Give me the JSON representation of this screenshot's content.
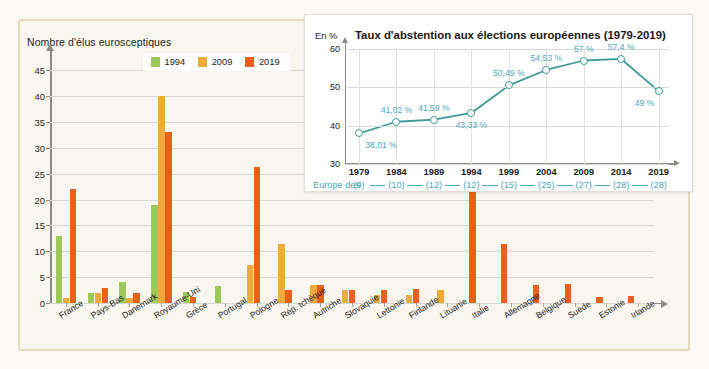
{
  "figure": {
    "background_color": "#f8f6ef",
    "border_color": "#e6d9b8"
  },
  "bar_chart": {
    "y_axis_title": "Nombre d'élus eurosceptiques",
    "y_ticks": [
      "0",
      "5",
      "10",
      "15",
      "20",
      "25",
      "30",
      "35",
      "40",
      "45"
    ],
    "legend": [
      {
        "label": "1994",
        "color": "#9dc95a"
      },
      {
        "label": "2009",
        "color": "#f0a93c"
      },
      {
        "label": "2019",
        "color": "#e8601c"
      }
    ]
  },
  "inset_chart": {
    "title": "Taux d'abstention aux élections européennes (1979-2019)",
    "unit_label": "En %",
    "y_ticks": [
      "30",
      "40",
      "50",
      "60"
    ],
    "europe_label": "Europe des",
    "line_color": "#3f9a9a",
    "label_color": "#4aa8bd"
  },
  "chart_data": [
    {
      "type": "bar",
      "title": "",
      "ylabel": "Nombre d'élus eurosceptiques",
      "xlabel": "",
      "ylim": [
        0,
        47
      ],
      "grid": true,
      "legend_position": "top-center",
      "categories": [
        "France",
        "Pays-Bas",
        "Danemark",
        "Royaume-Uni",
        "Grèce",
        "Portugal",
        "Pologne",
        "Rép. tchèque",
        "Autriche",
        "Slovaquie",
        "Lettonie",
        "Finlande",
        "Lituanie",
        "Italie",
        "Allemagne",
        "Belgique",
        "Suède",
        "Estonie",
        "Irlande"
      ],
      "series": [
        {
          "name": "1994",
          "color": "#9dc95a",
          "values": [
            13,
            2,
            4,
            19,
            2.2,
            3.2,
            0,
            0,
            0,
            0,
            0,
            0,
            0,
            0,
            0,
            0,
            0,
            0,
            0
          ]
        },
        {
          "name": "2009",
          "color": "#f0a93c",
          "values": [
            1,
            2,
            1,
            40,
            0,
            0,
            7.3,
            11.5,
            3.4,
            2.5,
            1.5,
            1.6,
            2.6,
            0,
            0,
            0,
            0,
            0,
            0
          ]
        },
        {
          "name": "2019",
          "color": "#e8601c",
          "values": [
            22,
            3,
            2,
            33,
            1.2,
            0,
            26.4,
            2.5,
            3.4,
            2.5,
            2.5,
            2.8,
            0,
            22.3,
            11.5,
            3.5,
            3.7,
            1.2,
            1.3
          ]
        }
      ]
    },
    {
      "type": "line",
      "title": "Taux d'abstention aux élections européennes (1979-2019)",
      "ylabel": "En %",
      "xlabel": "",
      "ylim": [
        30,
        60
      ],
      "grid": true,
      "x": [
        "1979",
        "1984",
        "1989",
        "1994",
        "1999",
        "2004",
        "2009",
        "2014",
        "2019"
      ],
      "values": [
        38.01,
        41.02,
        41.59,
        43.33,
        50.49,
        54.53,
        57,
        57.4,
        49
      ],
      "data_labels": [
        "38,01 %",
        "41,02 %",
        "41,59 %",
        "43,33 %",
        "50,49 %",
        "54,53 %",
        "57 %",
        "57,4 %",
        "49 %"
      ],
      "secondary_axis_label": "Europe des",
      "secondary_axis_values": [
        "(9)",
        "(10)",
        "(12)",
        "(12)",
        "(15)",
        "(25)",
        "(27)",
        "(28)",
        "(28)"
      ]
    }
  ]
}
